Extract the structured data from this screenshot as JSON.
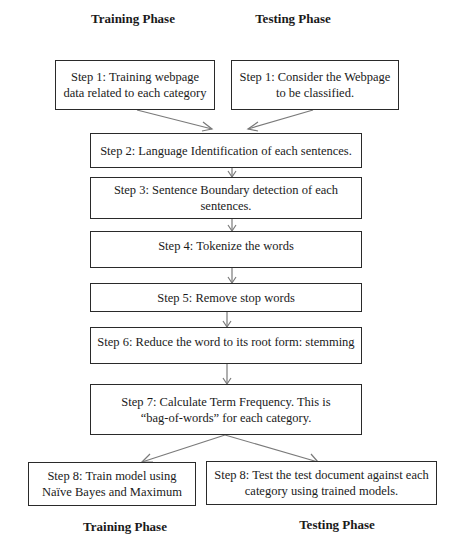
{
  "phases": {
    "top_left": "Training Phase",
    "top_right": "Testing Phase",
    "bottom_left": "Training Phase",
    "bottom_right": "Testing Phase"
  },
  "steps": {
    "step1_training": {
      "line1": "Step 1: Training webpage",
      "line2": "data related to each category"
    },
    "step1_testing": {
      "line1": "Step 1: Consider the Webpage",
      "line2": "to be classified."
    },
    "step2": {
      "line1": "Step 2:  Language Identification of each sentences."
    },
    "step3": {
      "line1": "Step 3:  Sentence Boundary detection of each",
      "line2": "sentences."
    },
    "step4": {
      "line1": "Step 4: Tokenize the words"
    },
    "step5": {
      "line1": "Step 5: Remove stop words"
    },
    "step6": {
      "line1": "Step 6: Reduce the word to its root form: stemming"
    },
    "step7": {
      "line1": "Step 7: Calculate Term Frequency.  This is",
      "line2": "“bag-of-words” for each category."
    },
    "step8_training": {
      "line1": "Step 8: Train model using",
      "line2": "Naïve Bayes and Maximum"
    },
    "step8_testing": {
      "line1": "Step 8: Test the test document against each",
      "line2": "category using trained models."
    }
  },
  "colors": {
    "line": "#7a7a7a",
    "border": "#2a2a2a",
    "text": "#1a1a1a"
  }
}
